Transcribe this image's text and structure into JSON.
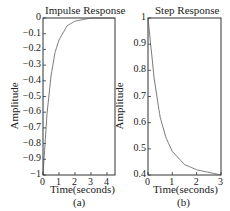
{
  "chart_data": [
    {
      "type": "line",
      "title": "Impulse Response",
      "xlabel": "Time(seconds)",
      "ylabel": "Amplitude",
      "caption": "(a)",
      "xlim": [
        0,
        4.5
      ],
      "ylim": [
        -1,
        0
      ],
      "xticks": [
        "0",
        "1",
        "2",
        "3",
        "4"
      ],
      "yticks": [
        "0",
        "-0.1",
        "-0.2",
        "-0.3",
        "-0.4",
        "-0.5",
        "-0.6",
        "-0.7",
        "-0.8",
        "-0.9",
        "-1"
      ],
      "grid": false,
      "series": [
        {
          "name": "impulse",
          "x": [
            0,
            0.25,
            0.5,
            0.75,
            1,
            1.5,
            2,
            2.5,
            3,
            4,
            4.5
          ],
          "y": [
            -1,
            -0.61,
            -0.37,
            -0.22,
            -0.14,
            -0.05,
            -0.02,
            -0.01,
            0,
            0,
            0
          ]
        }
      ]
    },
    {
      "type": "line",
      "title": "Step Response",
      "xlabel": "Time(seconds)",
      "ylabel": "Amplitude",
      "caption": "(b)",
      "xlim": [
        0,
        3
      ],
      "ylim": [
        0.4,
        1
      ],
      "xticks": [
        "0",
        "1",
        "2",
        "3"
      ],
      "yticks": [
        "1",
        "0.9",
        "0.8",
        "0.7",
        "0.6",
        "0.5",
        "0.4"
      ],
      "grid": false,
      "series": [
        {
          "name": "step",
          "x": [
            0,
            0.25,
            0.5,
            0.75,
            1,
            1.5,
            2,
            2.5,
            3
          ],
          "y": [
            1,
            0.77,
            0.62,
            0.54,
            0.49,
            0.44,
            0.42,
            0.41,
            0.4
          ]
        }
      ]
    }
  ]
}
